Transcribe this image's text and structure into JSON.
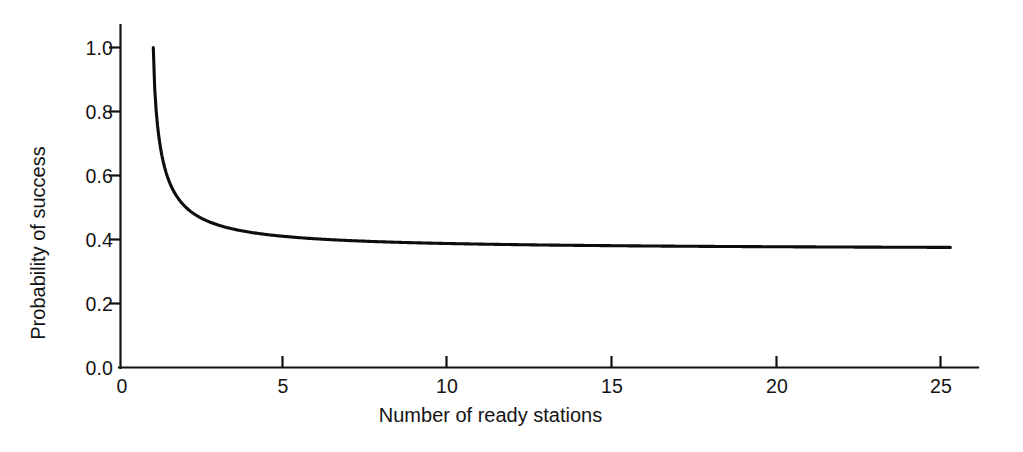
{
  "chart_data": {
    "type": "line",
    "title": "",
    "xlabel": "Number of ready stations",
    "ylabel": "Probability of success",
    "xlim": [
      0,
      26.5
    ],
    "ylim": [
      0.0,
      1.06
    ],
    "grid": false,
    "legend": "none",
    "x_ticks": [
      0,
      5,
      10,
      15,
      20,
      25
    ],
    "x_tick_labels": [
      "0",
      "5",
      "10",
      "15",
      "20",
      "25"
    ],
    "y_ticks": [
      0.0,
      0.2,
      0.4,
      0.6,
      0.8,
      1.0
    ],
    "y_tick_labels": [
      "0.0",
      "0.2",
      "0.4",
      "0.6",
      "0.8",
      "1.0"
    ],
    "line_color": "#0d0d0d",
    "series": [
      {
        "name": "Probability of success",
        "x": [
          1,
          1.25,
          1.5,
          1.75,
          2,
          2.25,
          2.5,
          2.75,
          3,
          3.25,
          3.5,
          3.75,
          4,
          4.5,
          5,
          5.5,
          6,
          6.5,
          7,
          7.5,
          8,
          9,
          10,
          11,
          12,
          13,
          14,
          15,
          16,
          17,
          18,
          19,
          20,
          21,
          22,
          23,
          24,
          25,
          25.3
        ],
        "y": [
          1.0,
          0.82,
          0.707,
          0.627,
          0.5,
          0.539,
          0.52,
          0.505,
          0.444,
          0.482,
          0.473,
          0.465,
          0.422,
          0.447,
          0.41,
          0.4,
          0.402,
          0.398,
          0.397,
          0.395,
          0.393,
          0.39,
          0.387,
          0.385,
          0.383,
          0.382,
          0.381,
          0.379,
          0.378,
          0.377,
          0.376,
          0.375,
          0.374,
          0.373,
          0.372,
          0.371,
          0.37,
          0.369,
          0.341
        ]
      }
    ]
  },
  "axes": {
    "y_title": "Probability of success",
    "x_title": "Number of ready stations",
    "y_tick_labels": [
      "1.0",
      "0.8",
      "0.6",
      "0.4",
      "0.2",
      "0.0"
    ],
    "x_tick_labels": [
      "0",
      "5",
      "10",
      "15",
      "20",
      "25"
    ]
  }
}
